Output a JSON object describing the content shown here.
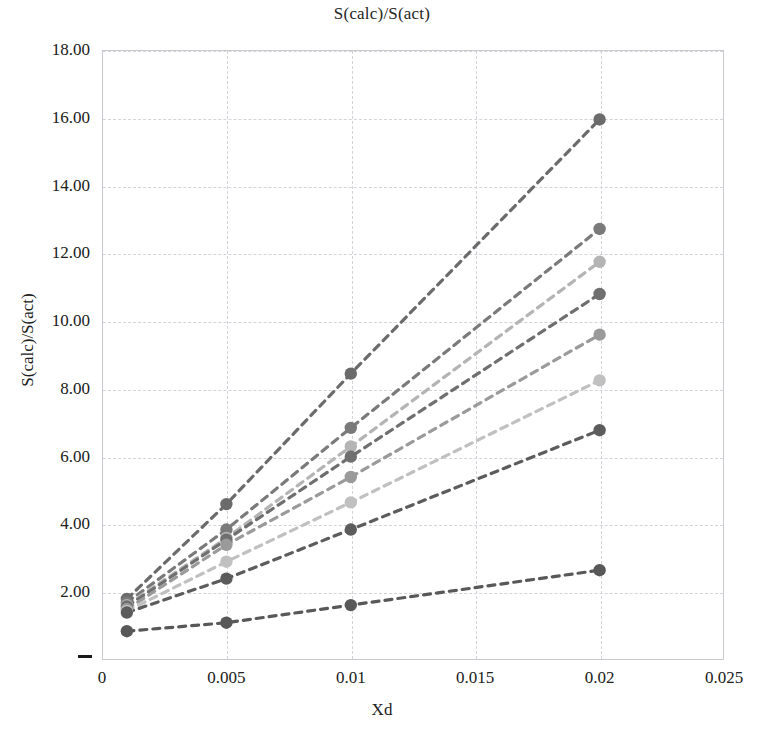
{
  "chart_data": {
    "type": "line",
    "title": "S(calc)/S(act)",
    "xlabel": "Xd",
    "ylabel": "S(calc)/S(act)",
    "xlim": [
      0,
      0.025
    ],
    "ylim": [
      0,
      18
    ],
    "grid": true,
    "legend": "none",
    "marker": "filled-circle",
    "linestyle": "dashed",
    "xticks": [
      "0",
      "0.005",
      "0.01",
      "0.015",
      "0.02",
      "0.025"
    ],
    "xtick_values": [
      0,
      0.005,
      0.01,
      0.015,
      0.02,
      0.025
    ],
    "yticks": [
      "2.00",
      "4.00",
      "6.00",
      "8.00",
      "10.00",
      "12.00",
      "14.00",
      "16.00",
      "18.00"
    ],
    "ytick_values": [
      2,
      4,
      6,
      8,
      10,
      12,
      14,
      16,
      18
    ],
    "y_zero_tick_mark": "–",
    "x": [
      0.001,
      0.005,
      0.01,
      0.02
    ],
    "series": [
      {
        "name": "series-1",
        "color": "#6b6b6b",
        "values": [
          1.8,
          4.6,
          8.45,
          15.95
        ]
      },
      {
        "name": "series-2",
        "color": "#7a7a7a",
        "values": [
          1.7,
          3.85,
          6.85,
          12.72
        ]
      },
      {
        "name": "series-3",
        "color": "#b4b4b4",
        "values": [
          1.62,
          3.6,
          6.3,
          11.75
        ]
      },
      {
        "name": "series-4",
        "color": "#6f6f6f",
        "values": [
          1.58,
          3.55,
          6.0,
          10.8
        ]
      },
      {
        "name": "series-5",
        "color": "#9a9a9a",
        "values": [
          1.5,
          3.4,
          5.4,
          9.6
        ]
      },
      {
        "name": "series-6",
        "color": "#c0c0c0",
        "values": [
          1.45,
          2.9,
          4.65,
          8.25
        ]
      },
      {
        "name": "series-7",
        "color": "#5c5c5c",
        "values": [
          1.4,
          2.4,
          3.85,
          6.78
        ]
      },
      {
        "name": "series-8",
        "color": "#585858",
        "values": [
          0.85,
          1.1,
          1.62,
          2.65
        ]
      }
    ]
  }
}
